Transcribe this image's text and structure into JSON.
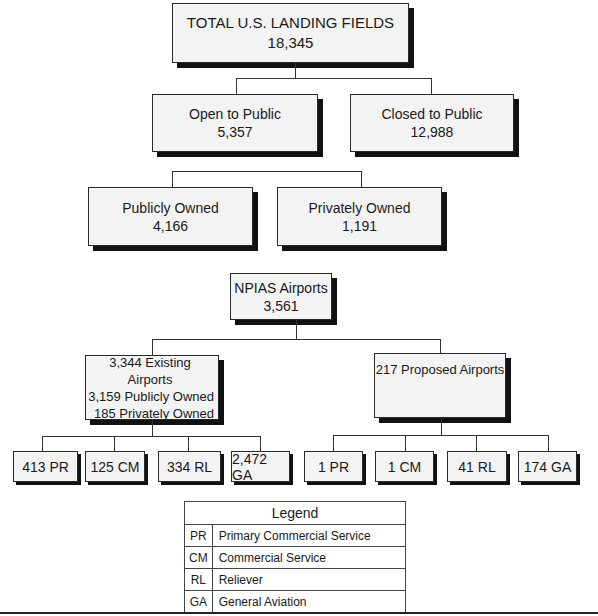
{
  "diagram": {
    "type": "hierarchy",
    "root": {
      "label": "TOTAL U.S. LANDING FIELDS",
      "value": "18,345"
    },
    "level1": [
      {
        "label": "Open to Public",
        "value": "5,357"
      },
      {
        "label": "Closed to Public",
        "value": "12,988"
      }
    ],
    "level2": [
      {
        "label": "Publicly Owned",
        "value": "4,166"
      },
      {
        "label": "Privately Owned",
        "value": "1,191"
      }
    ],
    "npias": {
      "label": "NPIAS Airports",
      "value": "3,561"
    },
    "existing": {
      "lines": [
        "3,344 Existing Airports",
        "3,159 Publicly Owned",
        "185 Privately Owned"
      ],
      "children": [
        "413 PR",
        "125 CM",
        "334 RL",
        "2,472 GA"
      ]
    },
    "proposed": {
      "lines": [
        "217 Proposed Airports"
      ],
      "children": [
        "1 PR",
        "1 CM",
        "41 RL",
        "174 GA"
      ]
    }
  },
  "legend": {
    "title": "Legend",
    "rows": [
      {
        "code": "PR",
        "meaning": "Primary Commercial Service"
      },
      {
        "code": "CM",
        "meaning": "Commercial Service"
      },
      {
        "code": "RL",
        "meaning": "Reliever"
      },
      {
        "code": "GA",
        "meaning": "General Aviation"
      }
    ]
  }
}
